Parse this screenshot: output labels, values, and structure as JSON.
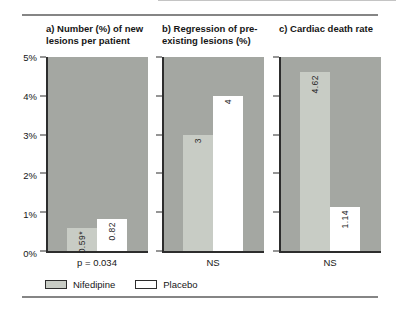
{
  "chart_data": {
    "type": "bar",
    "ymax_percent": 5,
    "ylim": [
      0,
      5
    ],
    "grid": false,
    "yticks": [
      "5%",
      "4%",
      "3%",
      "2%",
      "1%",
      "0%"
    ],
    "series_names": [
      "Nifedipine",
      "Placebo"
    ],
    "panels": [
      {
        "id": "a",
        "title": "a) Number (%) of new lesions per patient",
        "title_lines": [
          "a) Number (%) of new",
          "lesions per patient"
        ],
        "values": [
          0.59,
          0.82
        ],
        "bar_labels": [
          "0.59*",
          "0.82"
        ],
        "note": "p = 0.034"
      },
      {
        "id": "b",
        "title": "b) Regression of pre-existing lesions (%)",
        "title_lines": [
          "b) Regression of pre-",
          "existing lesions (%)"
        ],
        "values": [
          3,
          4
        ],
        "bar_labels": [
          "3",
          "4"
        ],
        "note": "NS"
      },
      {
        "id": "c",
        "title": "c) Cardiac death rate",
        "title_lines": [
          "c) Cardiac death rate"
        ],
        "values": [
          4.62,
          1.14
        ],
        "bar_labels": [
          "4.62",
          "1.14"
        ],
        "note": "NS"
      }
    ],
    "legend": [
      {
        "label": "Nifedipine",
        "color": "#c8ccc5"
      },
      {
        "label": "Placebo",
        "color": "#ffffff"
      }
    ],
    "colors": {
      "panel_bg": "#a4a7a2",
      "nifedipine_bar": "#c8ccc5",
      "placebo_bar": "#ffffff",
      "axis": "#2d2d2d",
      "text": "#161616"
    }
  }
}
